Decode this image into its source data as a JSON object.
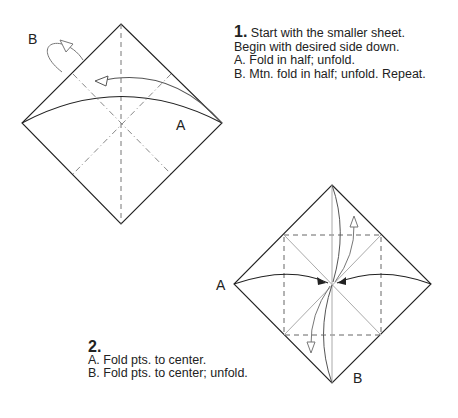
{
  "step1": {
    "number": "1.",
    "title": "Start with the smaller sheet.",
    "lines": [
      "Begin with desired side down.",
      "A. Fold in half; unfold.",
      "B. Mtn. fold in half; unfold.  Repeat."
    ],
    "labels": {
      "a": "A",
      "b": "B"
    }
  },
  "step2": {
    "number": "2.",
    "lines": [
      "A. Fold pts. to center.",
      "B. Fold pts. to center; unfold."
    ],
    "labels": {
      "a": "A",
      "b": "B"
    }
  },
  "colors": {
    "line": "#222222",
    "crease": "#888888",
    "arrow": "#666666"
  }
}
